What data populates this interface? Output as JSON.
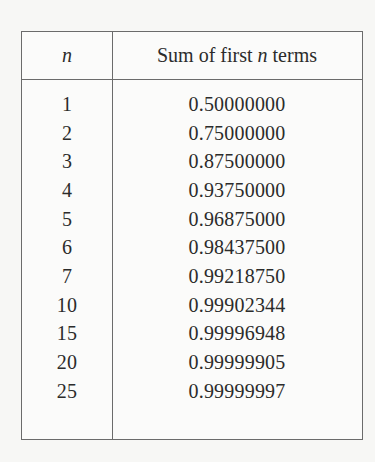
{
  "table": {
    "header": {
      "n_label": "n",
      "sum_label_prefix": "Sum of first ",
      "sum_label_var": "n",
      "sum_label_suffix": " terms"
    },
    "rows": [
      {
        "n": "1",
        "sum": "0.50000000"
      },
      {
        "n": "2",
        "sum": "0.75000000"
      },
      {
        "n": "3",
        "sum": "0.87500000"
      },
      {
        "n": "4",
        "sum": "0.93750000"
      },
      {
        "n": "5",
        "sum": "0.96875000"
      },
      {
        "n": "6",
        "sum": "0.98437500"
      },
      {
        "n": "7",
        "sum": "0.99218750"
      },
      {
        "n": "10",
        "sum": "0.99902344"
      },
      {
        "n": "15",
        "sum": "0.99996948"
      },
      {
        "n": "20",
        "sum": "0.99999905"
      },
      {
        "n": "25",
        "sum": "0.99999997"
      }
    ]
  }
}
